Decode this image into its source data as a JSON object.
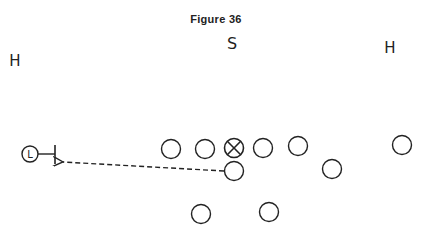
{
  "title": "Figure 36",
  "labels": {
    "safety": "S",
    "halfback_left": "H",
    "halfback_right": "H",
    "ball_carrier": "L"
  },
  "colors": {
    "ink": "#222222",
    "background": "#ffffff"
  },
  "players": [
    {
      "id": "o1",
      "x": 171,
      "y": 149,
      "type": "circle"
    },
    {
      "id": "o2",
      "x": 205,
      "y": 149,
      "type": "circle"
    },
    {
      "id": "center",
      "x": 234,
      "y": 148,
      "type": "crossed-circle"
    },
    {
      "id": "o4",
      "x": 263,
      "y": 148,
      "type": "circle"
    },
    {
      "id": "o5",
      "x": 298,
      "y": 146,
      "type": "circle"
    },
    {
      "id": "qb",
      "x": 234,
      "y": 171,
      "type": "circle"
    },
    {
      "id": "o7",
      "x": 332,
      "y": 169,
      "type": "circle"
    },
    {
      "id": "o8",
      "x": 402,
      "y": 145,
      "type": "circle"
    },
    {
      "id": "b1",
      "x": 201,
      "y": 214,
      "type": "circle"
    },
    {
      "id": "b2",
      "x": 269,
      "y": 212,
      "type": "circle"
    }
  ],
  "path": {
    "type": "dashed-arrow",
    "from": [
      224,
      171
    ],
    "to": [
      62,
      162
    ]
  }
}
